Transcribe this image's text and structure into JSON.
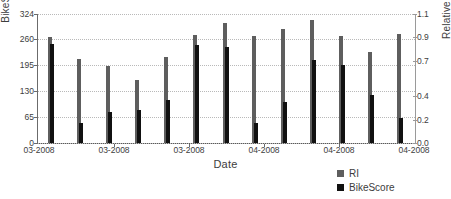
{
  "chart_data": {
    "type": "bar",
    "title": "",
    "subtitle": "",
    "xlabel": "Date",
    "ylabel": "BikeScore",
    "y2label": "Relative Intensity",
    "grid": true,
    "legend_position": "bottom-right",
    "xlim": [
      0,
      13
    ],
    "ylim": [
      0,
      324
    ],
    "y2lim": [
      0.0,
      1.1
    ],
    "yticks": [
      0,
      65,
      130,
      195,
      260,
      324
    ],
    "yticklabels": [
      "0",
      "65",
      "130",
      "195",
      "260",
      "324"
    ],
    "y2ticks": [
      0.0,
      0.2,
      0.4,
      0.7,
      0.9,
      1.1
    ],
    "y2ticklabels": [
      "0.0",
      "0.2",
      "0.4",
      "0.7",
      "0.9",
      "1.1"
    ],
    "xtickpositions": [
      0.17,
      0.5,
      2.5,
      4.5,
      6.5,
      8.5,
      12.6
    ],
    "xticklabels": [
      "03-2008",
      "03-2008",
      "03-2008",
      "04-2008",
      "04-2008",
      "04-2008"
    ],
    "categories": [
      "03-2008 a",
      "03-2008 b",
      "03-2008 c",
      "03-2008 d",
      "03-2008 e",
      "04-2008 f",
      "04-2008 g",
      "04-2008 h",
      "04-2008 i",
      "04-2008 j",
      "04-2008 k",
      "04-2008 l",
      "04-2008 m"
    ],
    "series": [
      {
        "name": "RI",
        "axis": "right",
        "color": "#5e5e5e",
        "values": [
          0.9,
          0.72,
          0.66,
          0.54,
          0.73,
          0.92,
          1.02,
          0.91,
          0.97,
          1.05,
          0.91,
          0.78,
          0.93
        ]
      },
      {
        "name": "BikeScore",
        "axis": "left",
        "color": "#111111",
        "values": [
          248,
          50,
          78,
          82,
          107,
          247,
          240,
          50,
          104,
          208,
          196,
          120,
          64
        ]
      }
    ],
    "legend_entries": [
      {
        "label": "RI",
        "color": "#5e5e5e"
      },
      {
        "label": "BikeScore",
        "color": "#111111"
      }
    ]
  },
  "axes": {
    "left_title": "BikeScore",
    "right_title": "Relative Intensity",
    "x_title": "Date"
  }
}
